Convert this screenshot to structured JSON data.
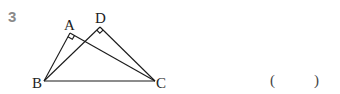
{
  "question": {
    "number": "3",
    "answer_open": "(",
    "answer_close": ")"
  },
  "diagram": {
    "points": {
      "A": {
        "label": "A",
        "x": 70,
        "y": 33
      },
      "B": {
        "label": "B",
        "x": 44,
        "y": 81
      },
      "C": {
        "label": "C",
        "x": 155,
        "y": 81
      },
      "D": {
        "label": "D",
        "x": 100,
        "y": 27
      }
    },
    "segments": [
      "AB",
      "AC",
      "BD",
      "DC",
      "BC"
    ],
    "right_angles": [
      "BAC",
      "BDC"
    ],
    "line_color": "#1a1a1a"
  }
}
